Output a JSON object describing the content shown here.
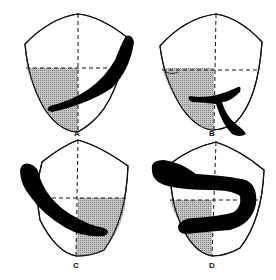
{
  "figure": {
    "panels": [
      {
        "label": "A",
        "shaded_quadrant": "lower-left"
      },
      {
        "label": "B",
        "shaded_quadrant": "lower-left"
      },
      {
        "label": "C",
        "shaded_quadrant": "lower-right"
      },
      {
        "label": "D",
        "shaded_quadrant": "lower-left"
      }
    ]
  },
  "colors": {
    "outline": "#111111",
    "shade": "#aaaaaa",
    "stroke": "#000000"
  }
}
